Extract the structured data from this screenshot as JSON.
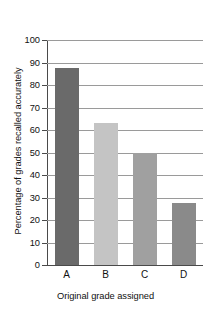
{
  "chart_data": {
    "type": "bar",
    "title": "",
    "categories": [
      "A",
      "B",
      "C",
      "D"
    ],
    "values": [
      87.5,
      63,
      50,
      27.5
    ],
    "series": [
      {
        "name": "Percentage of grades recalled accurately",
        "values": [
          87.5,
          63,
          50,
          27.5
        ]
      }
    ],
    "xlabel": "Original grade assigned",
    "ylabel": "Percentage of grades recalled accurately",
    "ylim": [
      0,
      100
    ],
    "ytick_labels": [
      "0",
      "10",
      "20",
      "30",
      "40",
      "50",
      "60",
      "70",
      "80",
      "90",
      "100"
    ],
    "ytick_values": [
      0,
      10,
      20,
      30,
      40,
      50,
      60,
      70,
      80,
      90,
      100
    ],
    "xtick_labels": [
      "A",
      "B",
      "C",
      "D"
    ],
    "grid": true,
    "grid_axis": "y",
    "legend": false,
    "legend_position": "none",
    "bar_colors": [
      "#6a6a6a",
      "#c4c4c4",
      "#a0a0a0",
      "#8a8a8a"
    ],
    "grid_color": "#9a9a9a",
    "axis_color": "#4a4a4a",
    "background_color": "#ffffff",
    "text_color": "#111111"
  }
}
